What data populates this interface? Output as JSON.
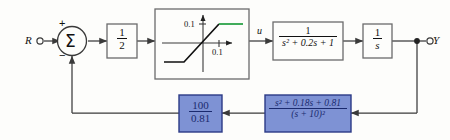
{
  "diagram": {
    "type": "control-system-block-diagram"
  },
  "signals": {
    "input_label": "R",
    "output_label": "Y",
    "control_label": "u"
  },
  "summer": {
    "symbol": "Σ",
    "plus_sign": "+",
    "minus_sign": "−"
  },
  "blocks": {
    "gain_half": {
      "numerator": "1",
      "denominator": "2"
    },
    "saturation": {
      "y_tick_label": "0.1",
      "x_tick_label": "0.1",
      "upper_limit": 0.1,
      "lower_limit": -0.1,
      "slope": 1,
      "saturated_segment_color": "#1f9e3e",
      "linear_segment_color": "#111111"
    },
    "plant": {
      "numerator": "1",
      "denominator": "s² + 0.2s + 1"
    },
    "integrator": {
      "numerator": "1",
      "denominator": "s"
    },
    "feedback_gain": {
      "numerator": "100",
      "denominator": "0.81",
      "fill_color": "#7e92d4",
      "text_color": "#1a2a6e"
    },
    "notch_filter": {
      "numerator": "s² + 0.18s + 0.81",
      "denominator": "(s + 10)²",
      "fill_color": "#7e92d4",
      "text_color": "#1a2a6e"
    }
  },
  "colors": {
    "line": "#3a3a3a",
    "block_border": "#6b6b6b",
    "blue_block_border": "#2b3a86",
    "background": "#fdfdfb"
  }
}
